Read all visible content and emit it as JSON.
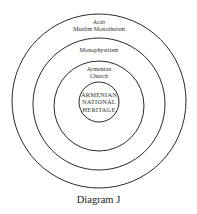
{
  "diagram": {
    "caption": "Diagram J",
    "rings": [
      {
        "id": "outer",
        "label_line1": "Arab",
        "label_line2": "Muslim Monotheism"
      },
      {
        "id": "second",
        "label_line1": "Monophysitism"
      },
      {
        "id": "third",
        "label_line1": "Armenian",
        "label_line2": "Church"
      },
      {
        "id": "core",
        "label_line1": "ARMENIAN",
        "label_line2": "NATIONAL",
        "label_line3": "HERITAGE"
      }
    ],
    "stroke_color": "#2a2a2a",
    "background": "#ffffff"
  }
}
